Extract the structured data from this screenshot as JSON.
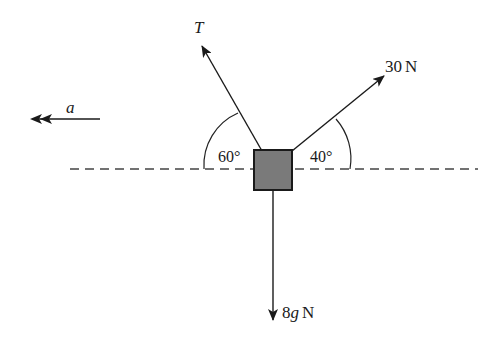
{
  "diagram": {
    "type": "free-body-diagram",
    "object": {
      "shape": "square-block",
      "fill": "#7a7a7a",
      "stroke": "#1a1a1a"
    },
    "reference_line": {
      "style": "dashed",
      "orientation": "horizontal"
    },
    "forces": [
      {
        "id": "tension",
        "label": "T",
        "angle_label": "60°",
        "angle_deg": 60,
        "side": "left",
        "direction": "up-left"
      },
      {
        "id": "applied",
        "label": "30 N",
        "angle_label": "40°",
        "angle_deg": 40,
        "side": "right",
        "direction": "up-right"
      },
      {
        "id": "weight",
        "label": "8g N",
        "direction": "down"
      }
    ],
    "acceleration": {
      "label": "a",
      "direction": "left",
      "arrowhead": "double"
    }
  },
  "labels": {
    "tension": "T",
    "applied_num": "30",
    "applied_unit": "N",
    "weight_num": "8",
    "weight_var": "g",
    "weight_unit": "N",
    "angle_left": "60°",
    "angle_right": "40°",
    "accel": "a"
  }
}
